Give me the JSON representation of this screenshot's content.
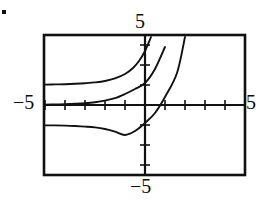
{
  "figure": {
    "kind": "graphing-calculator-plot",
    "bullet_marker": "•",
    "frame": {
      "left_px": 44,
      "top_px": 35,
      "right_px": 245,
      "bottom_px": 175,
      "stroke": "#111111",
      "stroke_width_px": 2.5
    },
    "labels": {
      "top": "5",
      "left": "−5",
      "right": "5",
      "bottom": "−5"
    },
    "axes": {
      "x_axis_y_px": 105,
      "y_axis_x_px": 145,
      "tick_spacing_px": 20,
      "tick_length_px": 5,
      "stroke": "#111111"
    },
    "colors": {
      "ink": "#111111",
      "background": "#ffffff",
      "curve": "#111111"
    }
  },
  "chart_data": {
    "type": "line",
    "title": "",
    "subtitle": "",
    "xlabel": "",
    "ylabel": "",
    "xlim": [
      -5,
      5
    ],
    "ylim": [
      -5,
      5
    ],
    "xticks": [
      -5,
      -4,
      -3,
      -2,
      -1,
      0,
      1,
      2,
      3,
      4,
      5
    ],
    "yticks": [
      -5,
      -4,
      -3,
      -2,
      -1,
      0,
      1,
      2,
      3,
      4,
      5
    ],
    "tick_labels_shown": {
      "top": "5",
      "bottom": "−5",
      "left": "−5",
      "right": "5"
    },
    "grid": false,
    "legend": null,
    "axis_style": "calculator-window-with-ticks",
    "series": [
      {
        "name": "upper curve",
        "asymptote_y": 1,
        "comment": "horizontal asymptote y = 1; crosses y-axis high and exits top of window near x = 0.7",
        "x": [
          -5.0,
          -4.5,
          -4.0,
          -3.5,
          -3.0,
          -2.5,
          -2.0,
          -1.5,
          -1.0,
          -0.6,
          -0.3,
          0.0,
          0.3,
          0.6,
          0.75
        ],
        "y": [
          1.02,
          1.03,
          1.04,
          1.06,
          1.09,
          1.13,
          1.2,
          1.33,
          1.55,
          1.85,
          2.2,
          2.7,
          3.4,
          4.4,
          5.0
        ]
      },
      {
        "name": "middle curve",
        "asymptote_y": 0,
        "comment": "horizontal asymptote y = 0 (the x-axis); crosses the y-axis around y = 1.1 and exits top of window near x = 1.5",
        "x": [
          -5.0,
          -4.5,
          -4.0,
          -3.5,
          -3.0,
          -2.5,
          -2.0,
          -1.5,
          -1.0,
          -0.5,
          0.0,
          0.5,
          1.0,
          1.3,
          1.5
        ],
        "y": [
          0.02,
          0.03,
          0.04,
          0.06,
          0.09,
          0.14,
          0.22,
          0.34,
          0.55,
          0.8,
          1.1,
          1.8,
          2.9,
          4.0,
          5.0
        ]
      },
      {
        "name": "lower curve",
        "asymptote_y": -1,
        "comment": "horizontal asymptote y = -1; crosses the x-axis near x = 1.6 and exits top of window near x = 2.2",
        "x": [
          -5.0,
          -4.5,
          -4.0,
          -3.5,
          -3.0,
          -2.5,
          -2.0,
          -1.5,
          -1.0,
          -0.5,
          0.0,
          0.5,
          1.0,
          1.6,
          2.0,
          2.2
        ],
        "y": [
          -1.02,
          -1.02,
          -1.03,
          -1.05,
          -1.08,
          -1.12,
          -1.2,
          -1.33,
          -1.5,
          -1.3,
          -0.9,
          -0.4,
          0.4,
          1.6,
          3.4,
          5.0
        ]
      }
    ]
  }
}
